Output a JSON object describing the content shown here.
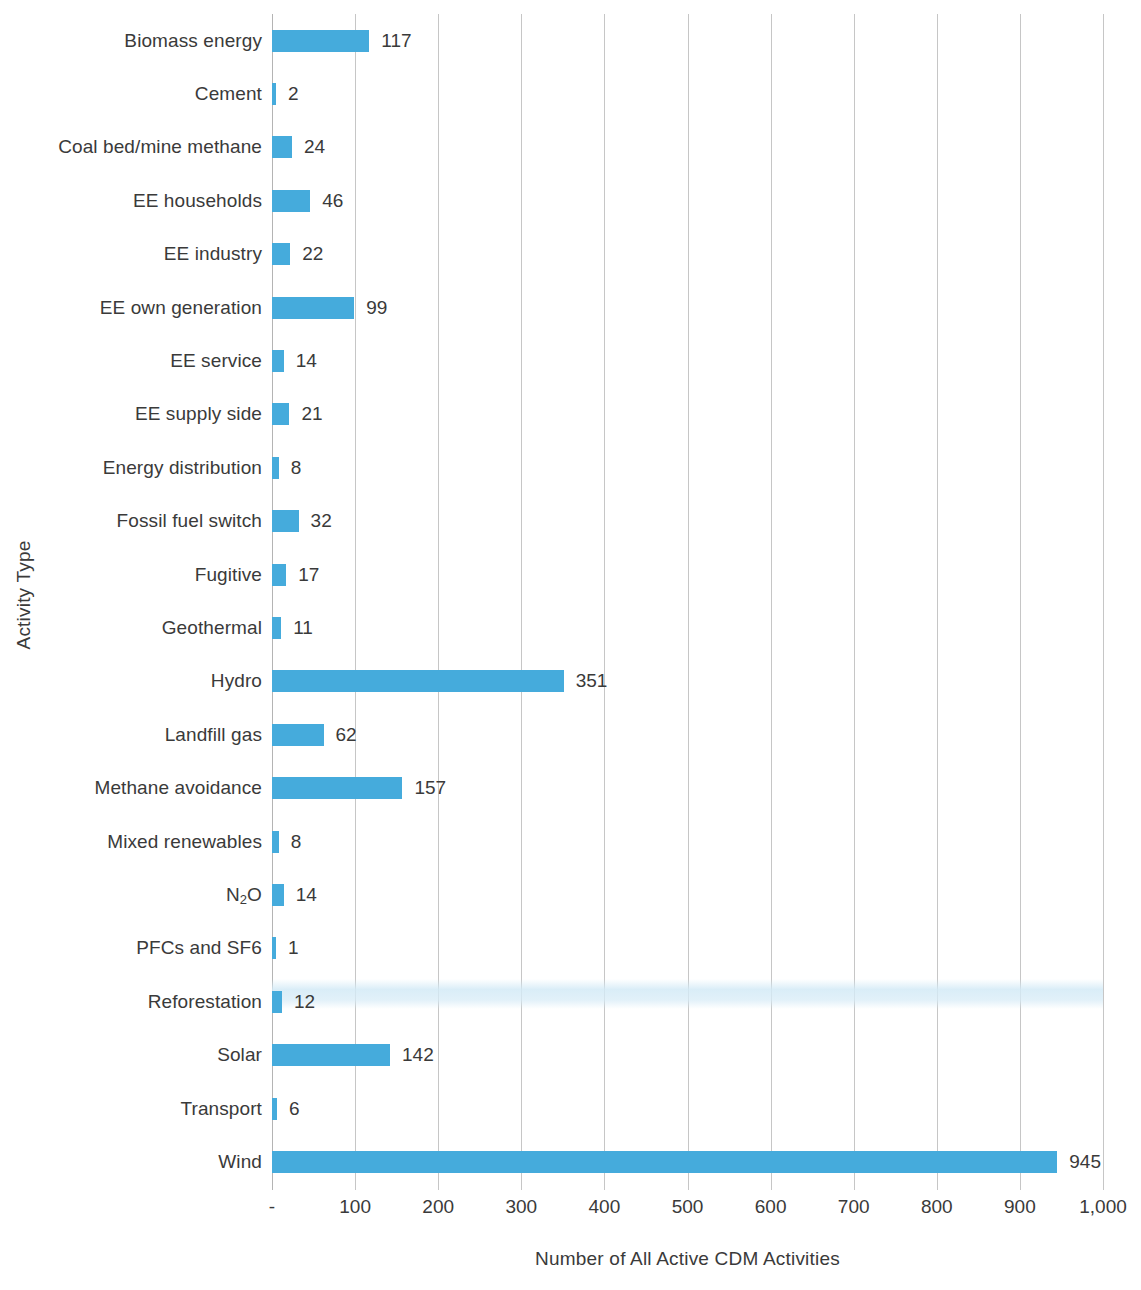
{
  "chart_data": {
    "type": "bar",
    "orientation": "horizontal",
    "title": "",
    "xlabel": "Number of All Active CDM Activities",
    "ylabel": "Activity Type",
    "xlim": [
      0,
      1000
    ],
    "grid": "vertical",
    "legend": "none",
    "bar_color": "#45ABDC",
    "axis_color": "#c6c6c6",
    "text_color": "#3a3a3a",
    "xticks": [
      0,
      100,
      200,
      300,
      400,
      500,
      600,
      700,
      800,
      900,
      1000
    ],
    "xtick_labels": [
      "-",
      "100",
      "200",
      "300",
      "400",
      "500",
      "600",
      "700",
      "800",
      "900",
      "1,000"
    ],
    "categories": [
      "Biomass energy",
      "Cement",
      "Coal bed/mine methane",
      "EE households",
      "EE industry",
      "EE own generation",
      "EE service",
      "EE supply side",
      "Energy distribution",
      "Fossil fuel switch",
      "Fugitive",
      "Geothermal",
      "Hydro",
      "Landfill gas",
      "Methane avoidance",
      "Mixed renewables",
      "N2O",
      "PFCs and SF6",
      "Reforestation",
      "Solar",
      "Transport",
      "Wind"
    ],
    "values": [
      117,
      2,
      24,
      46,
      22,
      99,
      14,
      21,
      8,
      32,
      17,
      11,
      351,
      62,
      157,
      8,
      14,
      1,
      12,
      142,
      6,
      945
    ],
    "value_labels": [
      "117",
      "2",
      "24",
      "46",
      "22",
      "99",
      "14",
      "21",
      "8",
      "32",
      "17",
      "11",
      "351",
      "62",
      "157",
      "8",
      "14",
      "1",
      "12",
      "142",
      "6",
      "945"
    ],
    "rows": [
      {
        "label": "Biomass energy",
        "label_html": "Biomass energy",
        "value": 117,
        "value_label": "117"
      },
      {
        "label": "Cement",
        "label_html": "Cement",
        "value": 2,
        "value_label": "2"
      },
      {
        "label": "Coal bed/mine methane",
        "label_html": "Coal bed/mine methane",
        "value": 24,
        "value_label": "24"
      },
      {
        "label": "EE households",
        "label_html": "EE households",
        "value": 46,
        "value_label": "46"
      },
      {
        "label": "EE industry",
        "label_html": "EE industry",
        "value": 22,
        "value_label": "22"
      },
      {
        "label": "EE own generation",
        "label_html": "EE own generation",
        "value": 99,
        "value_label": "99"
      },
      {
        "label": "EE service",
        "label_html": "EE service",
        "value": 14,
        "value_label": "14"
      },
      {
        "label": "EE supply side",
        "label_html": "EE supply side",
        "value": 21,
        "value_label": "21"
      },
      {
        "label": "Energy distribution",
        "label_html": "Energy distribution",
        "value": 8,
        "value_label": "8"
      },
      {
        "label": "Fossil fuel switch",
        "label_html": "Fossil fuel switch",
        "value": 32,
        "value_label": "32"
      },
      {
        "label": "Fugitive",
        "label_html": "Fugitive",
        "value": 17,
        "value_label": "17"
      },
      {
        "label": "Geothermal",
        "label_html": "Geothermal",
        "value": 11,
        "value_label": "11"
      },
      {
        "label": "Hydro",
        "label_html": "Hydro",
        "value": 351,
        "value_label": "351"
      },
      {
        "label": "Landfill gas",
        "label_html": "Landfill gas",
        "value": 62,
        "value_label": "62"
      },
      {
        "label": "Methane avoidance",
        "label_html": "Methane avoidance",
        "value": 157,
        "value_label": "157"
      },
      {
        "label": "Mixed renewables",
        "label_html": "Mixed renewables",
        "value": 8,
        "value_label": "8"
      },
      {
        "label": "N2O",
        "label_html": "N<sub>2</sub>O",
        "value": 14,
        "value_label": "14"
      },
      {
        "label": "PFCs and SF6",
        "label_html": "PFCs and SF6",
        "value": 1,
        "value_label": "1"
      },
      {
        "label": "Reforestation",
        "label_html": "Reforestation",
        "value": 12,
        "value_label": "12"
      },
      {
        "label": "Solar",
        "label_html": "Solar",
        "value": 142,
        "value_label": "142"
      },
      {
        "label": "Transport",
        "label_html": "Transport",
        "value": 6,
        "value_label": "6"
      },
      {
        "label": "Wind",
        "label_html": "Wind",
        "value": 945,
        "value_label": "945"
      }
    ]
  }
}
